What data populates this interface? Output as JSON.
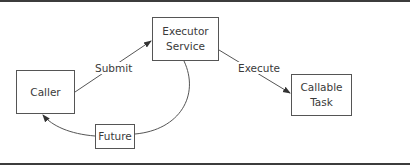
{
  "diagram": {
    "type": "flow",
    "nodes": [
      {
        "id": "caller",
        "label": "Caller"
      },
      {
        "id": "executor_service",
        "label": "Executor\nService"
      },
      {
        "id": "callable_task",
        "label": "Callable\nTask"
      },
      {
        "id": "future",
        "label": "Future"
      }
    ],
    "edges": [
      {
        "from": "caller",
        "to": "executor_service",
        "label": "Submit",
        "arrow": true
      },
      {
        "from": "executor_service",
        "to": "callable_task",
        "label": "Execute",
        "arrow": true
      },
      {
        "from": "executor_service",
        "to": "future",
        "label": "",
        "arrow": false
      },
      {
        "from": "future",
        "to": "caller",
        "label": "",
        "arrow": true
      }
    ]
  },
  "colors": {
    "rule": "#3c3c3c",
    "box_border": "#555555",
    "line": "#555555",
    "text": "#3a3a3a",
    "background": "#ffffff"
  }
}
